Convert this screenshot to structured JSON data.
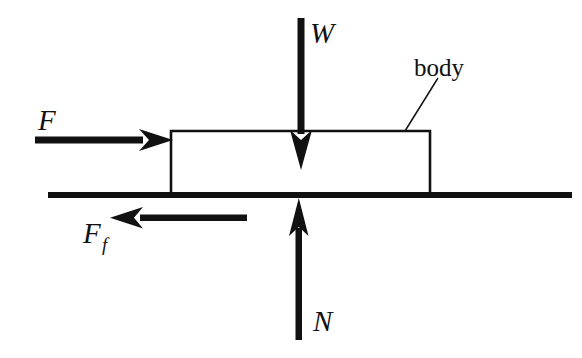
{
  "diagram": {
    "type": "free-body-diagram",
    "background_color": "#ffffff",
    "ink_color": "#111111",
    "labels": {
      "weight": "W",
      "applied_force": "F",
      "friction_force_base": "F",
      "friction_force_subscript": "f",
      "normal_force": "N",
      "body": "body"
    },
    "ground": {
      "x_start": 48,
      "x_end": 572,
      "y": 195,
      "thickness": 6,
      "color": "#111111"
    },
    "body_box": {
      "left": 171,
      "right": 430,
      "top": 131,
      "bottom": 195,
      "width": 259,
      "height": 64,
      "stroke_width": 2.5,
      "fill": "none",
      "stroke": "#111111"
    },
    "leader_line": {
      "from_x": 438,
      "from_y": 78,
      "to_x": 405,
      "to_y": 131,
      "stroke_width": 1.4
    },
    "arrows": [
      {
        "name": "weight-arrow",
        "label": "W",
        "direction": "down",
        "x": 301,
        "y_start": 18,
        "y_end": 170,
        "shaft_width": 7,
        "head_width": 22,
        "head_length": 40,
        "label_x": 310,
        "label_y": 42
      },
      {
        "name": "applied-force-arrow",
        "label": "F",
        "direction": "right",
        "y": 140,
        "x_start": 35,
        "x_end": 172,
        "shaft_width": 7,
        "head_width": 22,
        "head_length": 34,
        "label_x": 38,
        "label_y": 129
      },
      {
        "name": "friction-force-arrow",
        "label": "F_f",
        "direction": "left",
        "y": 218,
        "x_start": 247,
        "x_end": 110,
        "shaft_width": 7,
        "head_width": 22,
        "head_length": 30,
        "label_x": 83,
        "label_y": 243
      },
      {
        "name": "normal-force-arrow",
        "label": "N",
        "direction": "up",
        "x": 299,
        "y_start": 340,
        "y_end": 198,
        "shaft_width": 7,
        "head_width": 20,
        "head_length": 34,
        "label_x": 313,
        "label_y": 330
      }
    ],
    "font_sizes": {
      "force_label": 27,
      "subscript": 17,
      "body_label": 24
    },
    "body_label_position": {
      "x": 414,
      "y": 75
    }
  }
}
